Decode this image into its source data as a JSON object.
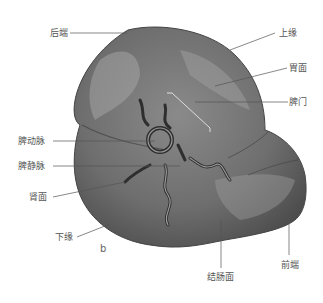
{
  "figure": {
    "panel_label": "b",
    "labels": {
      "posterior_end": "后端",
      "superior_border": "上缘",
      "gastric_surface": "胃面",
      "hilum": "脾门",
      "splenic_artery": "脾动脉",
      "splenic_vein": "脾静脉",
      "renal_surface": "肾面",
      "inferior_border": "下缘",
      "colic_surface": "结肠面",
      "anterior_end": "前端"
    }
  }
}
